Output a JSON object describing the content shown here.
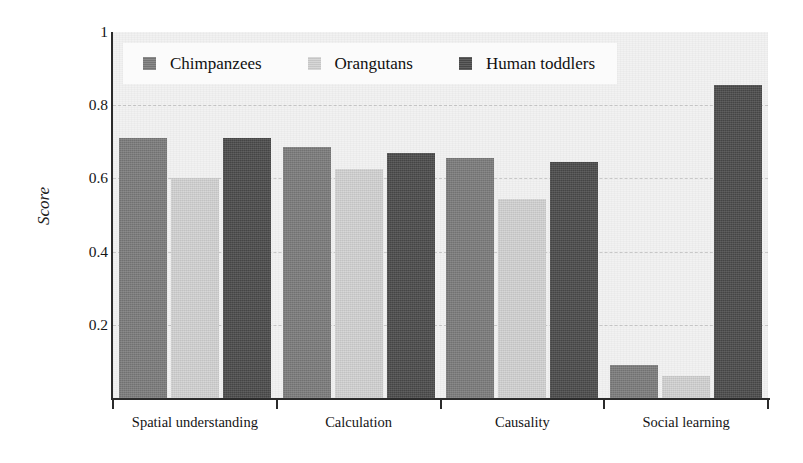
{
  "chart_data": {
    "type": "bar",
    "title": "",
    "xlabel": "",
    "ylabel": "Score",
    "ylim": [
      0,
      1
    ],
    "yticks": [
      "1",
      "0.8",
      "0.6",
      "0.4",
      "0.2"
    ],
    "ytick_values": [
      1,
      0.8,
      0.6,
      0.4,
      0.2
    ],
    "grid": true,
    "legend_position": "upper-left-inside",
    "categories": [
      "Spatial understanding",
      "Calculation",
      "Causality",
      "Social learning"
    ],
    "series": [
      {
        "name": "Chimpanzees",
        "color": "#7b7b7b",
        "values": [
          0.71,
          0.685,
          0.655,
          0.09
        ]
      },
      {
        "name": "Orangutans",
        "color": "#d2d2d2",
        "values": [
          0.6,
          0.625,
          0.545,
          0.06
        ]
      },
      {
        "name": "Human toddlers",
        "color": "#4b4b4b",
        "values": [
          0.71,
          0.67,
          0.645,
          0.855
        ]
      }
    ]
  },
  "axes": {
    "ylabel": "Score"
  },
  "colors": {
    "plot_background": "#f2f2f2",
    "axis": "#2b2b2b",
    "gridline": "#c9c9c9",
    "legend_background": "#fbfbfb"
  }
}
